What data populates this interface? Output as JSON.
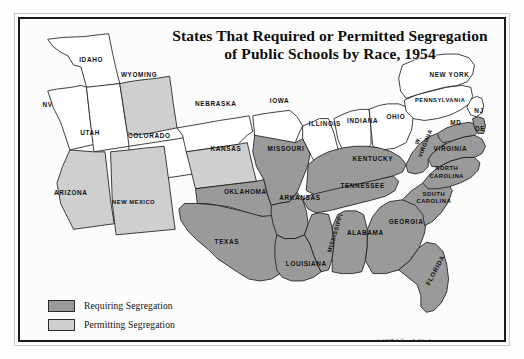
{
  "map": {
    "title_line1": "States That Required or Permitted Segregation",
    "title_line2": "of Public Schools by Race, 1954",
    "credit": "© 1997 Jeffrey L. Ward",
    "colors": {
      "requiring": "#9a9a9a",
      "permitting": "#cfcfcf",
      "none": "#ffffff",
      "outline": "#1b1b1b",
      "frame": "#1b1b1b",
      "background": "#ffffff",
      "label_text": "#111111"
    },
    "legend": {
      "items": [
        {
          "label": "Requiring Segregation",
          "swatch": "#9a9a9a",
          "category": "requiring"
        },
        {
          "label": "Permitting Segregation",
          "swatch": "#cfcfcf",
          "category": "permitting"
        }
      ]
    },
    "states": [
      {
        "code": "ID",
        "label": "IDAHO",
        "category": "none",
        "lx": 77,
        "ly": 43
      },
      {
        "code": "NV",
        "label": "NV",
        "category": "none",
        "lx": 30,
        "ly": 92
      },
      {
        "code": "UT",
        "label": "UTAH",
        "category": "none",
        "lx": 76,
        "ly": 123
      },
      {
        "code": "WY",
        "label": "WYOMING",
        "category": "permitting",
        "lx": 129,
        "ly": 60
      },
      {
        "code": "CO",
        "label": "COLORADO",
        "category": "none",
        "lx": 140,
        "ly": 126
      },
      {
        "code": "NE",
        "label": "NEBRASKA",
        "category": "none",
        "lx": 212,
        "ly": 91
      },
      {
        "code": "IA",
        "label": "IOWA",
        "category": "none",
        "lx": 281,
        "ly": 88
      },
      {
        "code": "IL",
        "label": "ILLINOIS",
        "category": "none",
        "lx": 330,
        "ly": 113
      },
      {
        "code": "IN",
        "label": "INDIANA",
        "category": "none",
        "lx": 371,
        "ly": 110
      },
      {
        "code": "OH",
        "label": "OHIO",
        "category": "none",
        "lx": 407,
        "ly": 105
      },
      {
        "code": "KS",
        "label": "KANSAS",
        "category": "permitting",
        "lx": 223,
        "ly": 140
      },
      {
        "code": "AZ",
        "label": "ARIZONA",
        "category": "permitting",
        "lx": 55,
        "ly": 188
      },
      {
        "code": "NM",
        "label": "NEW MEXICO",
        "category": "permitting",
        "lx": 123,
        "ly": 198
      },
      {
        "code": "OK",
        "label": "OKLAHOMA",
        "category": "requiring",
        "lx": 244,
        "ly": 186
      },
      {
        "code": "TX",
        "label": "TEXAS",
        "category": "requiring",
        "lx": 224,
        "ly": 241
      },
      {
        "code": "MO",
        "label": "MISSOURI",
        "category": "requiring",
        "lx": 288,
        "ly": 140
      },
      {
        "code": "AR",
        "label": "ARKANSAS",
        "category": "requiring",
        "lx": 303,
        "ly": 193
      },
      {
        "code": "LA",
        "label": "LOUISIANA",
        "category": "requiring",
        "lx": 310,
        "ly": 265
      },
      {
        "code": "MS",
        "label": "MISSISSIPPI",
        "category": "requiring",
        "lx": 341,
        "ly": 232,
        "rotate": -73
      },
      {
        "code": "AL",
        "label": "ALABAMA",
        "category": "requiring",
        "lx": 374,
        "ly": 231
      },
      {
        "code": "TN",
        "label": "TENNESSEE",
        "category": "requiring",
        "lx": 371,
        "ly": 180
      },
      {
        "code": "KY",
        "label": "KENTUCKY",
        "category": "requiring",
        "lx": 382,
        "ly": 151
      },
      {
        "code": "GA",
        "label": "GEORGIA",
        "category": "requiring",
        "lx": 418,
        "ly": 219
      },
      {
        "code": "FL",
        "label": "FLORIDA",
        "category": "requiring",
        "lx": 449,
        "ly": 272,
        "rotate": -62
      },
      {
        "code": "SC",
        "label": "SOUTH\nCAROLINA",
        "category": "requiring",
        "lx": 448,
        "ly": 195
      },
      {
        "code": "NC",
        "label": "NORTH\nCAROLINA",
        "category": "requiring",
        "lx": 462,
        "ly": 167
      },
      {
        "code": "VA",
        "label": "VIRGINIA",
        "category": "requiring",
        "lx": 466,
        "ly": 140
      },
      {
        "code": "WV",
        "label": "W.\nVIRGINIA",
        "category": "requiring",
        "lx": 435,
        "ly": 133,
        "rotate": -68
      },
      {
        "code": "MD",
        "label": "MD",
        "category": "requiring",
        "lx": 472,
        "ly": 112
      },
      {
        "code": "DE",
        "label": "DE",
        "category": "requiring",
        "lx": 498,
        "ly": 118
      },
      {
        "code": "NJ",
        "label": "NJ",
        "category": "none",
        "lx": 497,
        "ly": 99
      },
      {
        "code": "PA",
        "label": "PENNSYLVANIA",
        "category": "none",
        "lx": 455,
        "ly": 88
      },
      {
        "code": "NY",
        "label": "NEW YORK",
        "category": "none",
        "lx": 465,
        "ly": 60
      }
    ]
  }
}
